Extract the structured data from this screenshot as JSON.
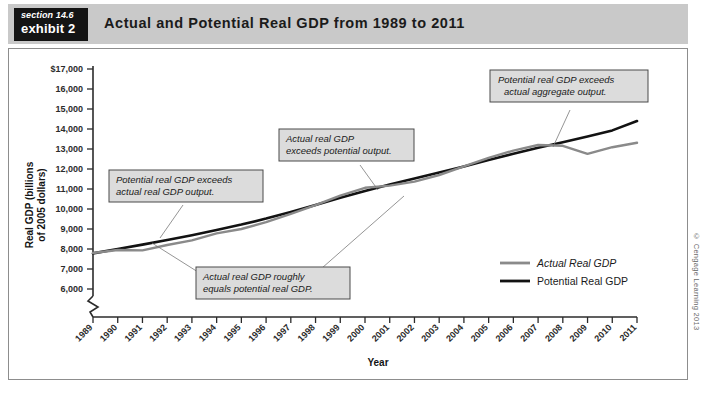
{
  "header": {
    "section_label": "section 14.6",
    "exhibit_label": "exhibit 2",
    "title": "Actual and Potential Real GDP from 1989 to 2011"
  },
  "copyright": "© Cengage Learning 2013",
  "callouts": [
    {
      "id": "callout-potential-exceeds-actual",
      "line1": "Potential real GDP exceeds",
      "line2": "actual real GDP output."
    },
    {
      "id": "callout-actual-exceeds-potential",
      "line1": "Actual real GDP",
      "line2": "exceeds potential output."
    },
    {
      "id": "callout-potential-exceeds-aggregate",
      "line1": "Potential real GDP exceeds",
      "line2": "actual aggregate output."
    },
    {
      "id": "callout-actual-equals-potential",
      "line1": "Actual real GDP roughly",
      "line2": "equals potential real GDP."
    }
  ],
  "chart_data": {
    "type": "line",
    "title": "Actual and Potential Real GDP from 1989 to 2011",
    "xlabel": "Year",
    "ylabel": "Real GDP (billions of 2005 dollars)",
    "ylabel_line1": "Real GDP (billions",
    "ylabel_line2": "of 2005 dollars)",
    "grid": false,
    "axis_break": true,
    "legend_position": "bottom-right",
    "xlim": [
      1989,
      2011
    ],
    "ylim": [
      6000,
      17000
    ],
    "ytick_labels": [
      "$17,000",
      "16,000",
      "15,000",
      "14,000",
      "13,000",
      "12,000",
      "11,000",
      "10,000",
      "9,000",
      "8,000",
      "7,000",
      "6,000"
    ],
    "yticks": [
      17000,
      16000,
      15000,
      14000,
      13000,
      12000,
      11000,
      10000,
      9000,
      8000,
      7000,
      6000
    ],
    "categories": [
      1989,
      1990,
      1991,
      1992,
      1993,
      1994,
      1995,
      1996,
      1997,
      1998,
      1999,
      2000,
      2001,
      2002,
      2003,
      2004,
      2005,
      2006,
      2007,
      2008,
      2009,
      2010,
      2011
    ],
    "xtick_labels": [
      "1989",
      "1990",
      "1991",
      "1992",
      "1993",
      "1994",
      "1995",
      "1996",
      "1997",
      "1998",
      "1999",
      "2000",
      "2001",
      "2002",
      "2003",
      "2004",
      "2005",
      "2006",
      "2007",
      "2008",
      "2009",
      "2010",
      "2011"
    ],
    "series": [
      {
        "name": "Actual Real GDP",
        "color": "#8a8a8a",
        "style": "italic",
        "values": [
          7800,
          7950,
          7930,
          8200,
          8430,
          8780,
          9000,
          9340,
          9760,
          10190,
          10670,
          11060,
          11170,
          11370,
          11700,
          12130,
          12560,
          12920,
          13200,
          13160,
          12760,
          13090,
          13310
        ]
      },
      {
        "name": "Potential Real GDP",
        "color": "#121212",
        "style": "normal",
        "values": [
          7780,
          8000,
          8220,
          8450,
          8690,
          8950,
          9220,
          9520,
          9850,
          10200,
          10560,
          10900,
          11220,
          11520,
          11820,
          12130,
          12450,
          12760,
          13060,
          13340,
          13620,
          13930,
          14400
        ]
      }
    ]
  }
}
